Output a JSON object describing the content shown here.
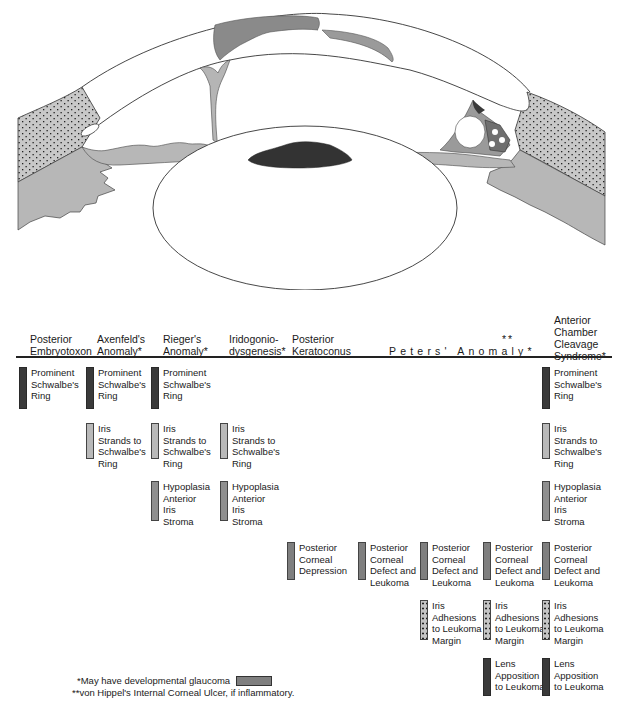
{
  "diagram": {
    "eye_illustration": {
      "parts": [
        "cornea",
        "limbus-sclera",
        "iris",
        "lens",
        "ciliary-body",
        "trabecular-meshwork",
        "schwalbe-ring",
        "corneal-leukoma",
        "iris-strands"
      ]
    },
    "columns": [
      {
        "id": "posterior-embryotoxon",
        "header": "Posterior\nEmbryotoxon"
      },
      {
        "id": "axenfelds-anomaly",
        "header": "Axenfeld's\nAnomaly*"
      },
      {
        "id": "riegers-anomaly",
        "header": "Rieger's\nAnomaly*"
      },
      {
        "id": "iridogoniodysgenesis",
        "header": "Iridogonio-\ndysgenesis*"
      },
      {
        "id": "posterior-keratoconus",
        "header": "Posterior\nKeratoconus"
      },
      {
        "id": "peters-anomaly",
        "header": "Peters' Anomaly*",
        "superscript": "**"
      },
      {
        "id": "anterior-chamber-cleavage-syndrome",
        "header": "Anterior\nChamber\nCleavage\nSyndrome*"
      }
    ],
    "features": {
      "prominent_schwalbe": "Prominent\nSchwalbe's\nRing",
      "iris_strands": "Iris\nStrands to\nSchwalbe's\nRing",
      "hypoplasia": "Hypoplasia\nAnterior\nIris\nStroma",
      "posterior_corneal_depression": "Posterior\nCorneal\nDepression",
      "posterior_corneal_defect": "Posterior\nCorneal\nDefect and\nLeukoma",
      "iris_adhesions": "Iris\nAdhesions\nto Leukoma\nMargin",
      "lens_apposition": "Lens\nApposition\nto Leukoma"
    },
    "footnotes": {
      "one_star": "*May have developmental glaucoma",
      "two_star": "**von Hippel's Internal Corneal Ulcer, if inflammatory."
    },
    "colors": {
      "dark": "#3a3a3a",
      "mid": "#8f8f8f",
      "light": "#b9b9b9",
      "stippled": "#c4c4c4"
    }
  }
}
